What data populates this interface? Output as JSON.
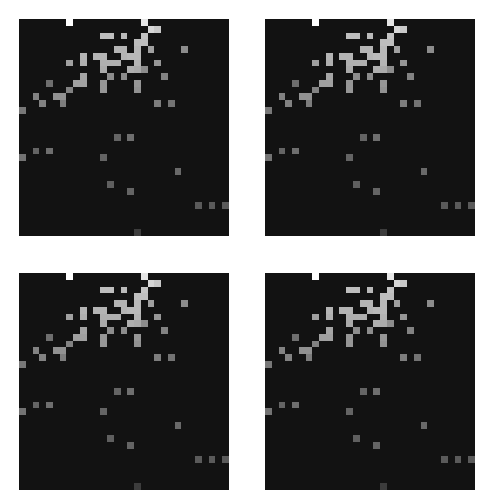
{
  "figure": {
    "background": "#ffffff",
    "panel_background": "#121212",
    "panels": [
      {
        "id": "top-left",
        "x": 19,
        "y": 19
      },
      {
        "id": "top-right",
        "x": 265,
        "y": 19
      },
      {
        "id": "bottom-left",
        "x": 19,
        "y": 273
      },
      {
        "id": "bottom-right",
        "x": 265,
        "y": 273
      }
    ],
    "cell_size": 6.77
  },
  "chart_data": {
    "type": "heatmap",
    "title": "",
    "xlabel": "",
    "ylabel": "",
    "grid": false,
    "legend": null,
    "colormap": "grayscale",
    "columns": 31,
    "rows": 32,
    "panel_count": 4,
    "note": "Four near-identical grayscale pixel-grid panels; values are intensities 0-255 at (row, col)",
    "cells": [
      {
        "r": 0,
        "c": 7,
        "v": 255
      },
      {
        "r": 0,
        "c": 18,
        "v": 230
      },
      {
        "r": 1,
        "c": 19,
        "v": 215
      },
      {
        "r": 1,
        "c": 20,
        "v": 200
      },
      {
        "r": 2,
        "c": 12,
        "v": 190
      },
      {
        "r": 2,
        "c": 13,
        "v": 190
      },
      {
        "r": 2,
        "c": 15,
        "v": 185
      },
      {
        "r": 2,
        "c": 18,
        "v": 195
      },
      {
        "r": 3,
        "c": 17,
        "v": 190
      },
      {
        "r": 3,
        "c": 18,
        "v": 190
      },
      {
        "r": 4,
        "c": 14,
        "v": 180
      },
      {
        "r": 4,
        "c": 15,
        "v": 180
      },
      {
        "r": 4,
        "c": 17,
        "v": 185
      },
      {
        "r": 4,
        "c": 19,
        "v": 160
      },
      {
        "r": 4,
        "c": 24,
        "v": 140
      },
      {
        "r": 5,
        "c": 9,
        "v": 180
      },
      {
        "r": 5,
        "c": 11,
        "v": 180
      },
      {
        "r": 5,
        "c": 12,
        "v": 180
      },
      {
        "r": 5,
        "c": 15,
        "v": 180
      },
      {
        "r": 5,
        "c": 16,
        "v": 185
      },
      {
        "r": 5,
        "c": 17,
        "v": 185
      },
      {
        "r": 6,
        "c": 7,
        "v": 160
      },
      {
        "r": 6,
        "c": 9,
        "v": 175
      },
      {
        "r": 6,
        "c": 12,
        "v": 175
      },
      {
        "r": 6,
        "c": 13,
        "v": 175
      },
      {
        "r": 6,
        "c": 14,
        "v": 175
      },
      {
        "r": 6,
        "c": 17,
        "v": 180
      },
      {
        "r": 6,
        "c": 20,
        "v": 150
      },
      {
        "r": 7,
        "c": 12,
        "v": 170
      },
      {
        "r": 7,
        "c": 16,
        "v": 175
      },
      {
        "r": 7,
        "c": 17,
        "v": 170
      },
      {
        "r": 7,
        "c": 18,
        "v": 140
      },
      {
        "r": 8,
        "c": 9,
        "v": 165
      },
      {
        "r": 8,
        "c": 13,
        "v": 140
      },
      {
        "r": 8,
        "c": 15,
        "v": 140
      },
      {
        "r": 8,
        "c": 21,
        "v": 130
      },
      {
        "r": 9,
        "c": 4,
        "v": 110
      },
      {
        "r": 9,
        "c": 8,
        "v": 160
      },
      {
        "r": 9,
        "c": 9,
        "v": 160
      },
      {
        "r": 9,
        "c": 12,
        "v": 150
      },
      {
        "r": 9,
        "c": 17,
        "v": 150
      },
      {
        "r": 10,
        "c": 7,
        "v": 130
      },
      {
        "r": 10,
        "c": 12,
        "v": 150
      },
      {
        "r": 10,
        "c": 17,
        "v": 145
      },
      {
        "r": 11,
        "c": 2,
        "v": 130
      },
      {
        "r": 11,
        "c": 5,
        "v": 145
      },
      {
        "r": 11,
        "c": 6,
        "v": 145
      },
      {
        "r": 12,
        "c": 3,
        "v": 130
      },
      {
        "r": 12,
        "c": 6,
        "v": 125
      },
      {
        "r": 12,
        "c": 20,
        "v": 125
      },
      {
        "r": 12,
        "c": 22,
        "v": 115
      },
      {
        "r": 13,
        "c": 0,
        "v": 120
      },
      {
        "r": 17,
        "c": 14,
        "v": 100
      },
      {
        "r": 17,
        "c": 16,
        "v": 110
      },
      {
        "r": 19,
        "c": 2,
        "v": 100
      },
      {
        "r": 19,
        "c": 4,
        "v": 110
      },
      {
        "r": 20,
        "c": 0,
        "v": 115
      },
      {
        "r": 20,
        "c": 12,
        "v": 100
      },
      {
        "r": 22,
        "c": 23,
        "v": 105
      },
      {
        "r": 24,
        "c": 13,
        "v": 95
      },
      {
        "r": 25,
        "c": 16,
        "v": 100
      },
      {
        "r": 27,
        "c": 26,
        "v": 90
      },
      {
        "r": 27,
        "c": 28,
        "v": 90
      },
      {
        "r": 27,
        "c": 30,
        "v": 90
      },
      {
        "r": 31,
        "c": 17,
        "v": 60
      }
    ]
  }
}
